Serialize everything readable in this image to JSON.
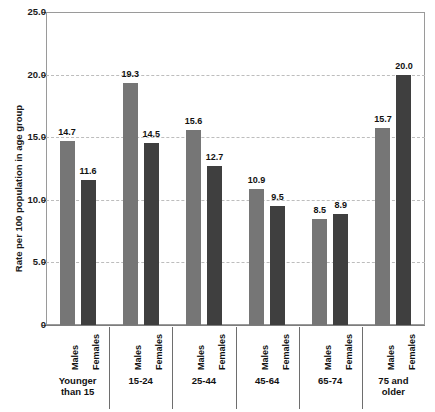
{
  "chart_data": {
    "type": "bar",
    "title": "",
    "subtitle": "",
    "xlabel": "",
    "ylabel": "Rate per 100 population in age group",
    "ylim": [
      0,
      25
    ],
    "ytick_labels": [
      "25.0",
      "20.0",
      "15.0",
      "10.0",
      "5.0",
      "0"
    ],
    "ytick_values": [
      25.0,
      20.0,
      15.0,
      10.0,
      5.0,
      0
    ],
    "grid": "horizontal-dashed",
    "legend": "none",
    "categories": [
      "Younger\nthan 15",
      "15-24",
      "25-44",
      "45-64",
      "65-74",
      "75 and\nolder"
    ],
    "series": [
      {
        "name": "Males",
        "color": "#767676",
        "values": [
          14.7,
          19.3,
          15.6,
          10.9,
          8.5,
          15.7
        ],
        "labels": [
          "14.7",
          "19.3",
          "15.6",
          "10.9",
          "8.5",
          "15.7"
        ]
      },
      {
        "name": "Females",
        "color": "#3f3f3f",
        "values": [
          11.6,
          14.5,
          12.7,
          9.5,
          8.9,
          20.0
        ],
        "labels": [
          "11.6",
          "14.5",
          "12.7",
          "9.5",
          "8.9",
          "20.0"
        ]
      }
    ]
  },
  "axis": {
    "y_title": "Rate per 100 population in age group"
  },
  "colors": {
    "males_bar": "#767676",
    "females_bar": "#3f3f3f",
    "gridline": "#bdbdbd",
    "frame": "#9a9a9a",
    "text": "#111111",
    "background": "#ffffff"
  }
}
